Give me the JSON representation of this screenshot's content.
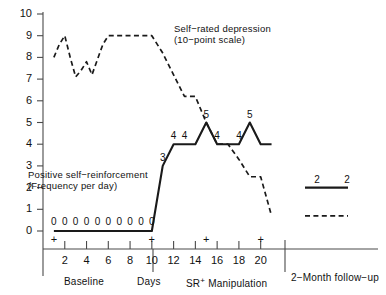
{
  "chart_data": {
    "type": "line",
    "title": "",
    "xlabel": "Days",
    "ylabel": "",
    "ylim": [
      0,
      10
    ],
    "xlim": [
      0,
      21.5
    ],
    "grid": false,
    "legend_position": "inline-annotation",
    "y_ticks": [
      "0",
      "1",
      "2",
      "3",
      "4",
      "5",
      "6",
      "7",
      "8",
      "9",
      "10"
    ],
    "x_ticks": [
      "2",
      "4",
      "6",
      "8",
      "10",
      "12",
      "14",
      "16",
      "18",
      "20"
    ],
    "x_tick_values": [
      2,
      4,
      6,
      8,
      10,
      12,
      14,
      16,
      18,
      20
    ],
    "series": [
      {
        "name": "Self-rated depression (10-point scale)",
        "style": "dashed",
        "x": [
          1,
          1.5,
          2,
          2.5,
          3,
          3.5,
          4,
          4.5,
          5,
          5.5,
          6,
          7,
          8,
          9,
          10,
          11,
          12,
          13,
          14,
          15,
          16,
          17,
          18,
          19,
          20,
          21
        ],
        "values": [
          8.0,
          8.6,
          9.0,
          8.0,
          7.1,
          7.4,
          7.8,
          7.2,
          7.9,
          8.6,
          9.0,
          9.0,
          9.0,
          9.0,
          9.0,
          8.2,
          7.2,
          6.2,
          6.2,
          5.0,
          4.0,
          4.0,
          3.3,
          2.5,
          2.5,
          0.7
        ]
      },
      {
        "name": "Positive self-reinforcement (Frequency per day)",
        "style": "solid",
        "x": [
          1,
          2,
          3,
          4,
          5,
          6,
          7,
          8,
          9,
          10,
          11,
          12,
          13,
          14,
          15,
          16,
          17,
          18,
          19,
          20,
          21
        ],
        "values": [
          0,
          0,
          0,
          0,
          0,
          0,
          0,
          0,
          0,
          0,
          3,
          4,
          4,
          4,
          5,
          4,
          4,
          4,
          5,
          4,
          4
        ]
      }
    ],
    "baseline_zero_labels": [
      "0",
      "0",
      "0",
      "0",
      "0",
      "0",
      "0",
      "0",
      "0",
      "0"
    ],
    "treatment_point_labels": [
      {
        "label": "3",
        "x": 11,
        "y": 3
      },
      {
        "label": "4",
        "x": 12,
        "y": 4
      },
      {
        "label": "4",
        "x": 13,
        "y": 4
      },
      {
        "label": "5",
        "x": 15,
        "y": 5
      },
      {
        "label": "4",
        "x": 16,
        "y": 4
      },
      {
        "label": "4",
        "x": 18,
        "y": 4
      },
      {
        "label": "5",
        "x": 19,
        "y": 5
      }
    ],
    "followup": {
      "solid_value": 2,
      "solid_labels": [
        "2",
        "2"
      ],
      "dashed_value": 0.7
    },
    "event_markers": {
      "symbol": "+",
      "x_values": [
        1,
        10,
        15,
        20
      ]
    },
    "annotations": [
      {
        "id": "depression-annotation",
        "line1": "Self−rated depression",
        "line2": "(10−point scale)"
      },
      {
        "id": "reinforcement-annotation",
        "line1": "Positive self−reinforcement",
        "line2": "(Frequency per day)"
      }
    ],
    "phase_labels": {
      "baseline": "Baseline",
      "axis_title": "Days",
      "manipulation_prefix": "SR",
      "manipulation_sup": "+",
      "manipulation_suffix": "Manipulation",
      "followup": "2−Month follow−up"
    },
    "colors": {
      "line": "#1a1a1a",
      "axis": "#4a4a4a",
      "background": "#ffffff"
    }
  }
}
